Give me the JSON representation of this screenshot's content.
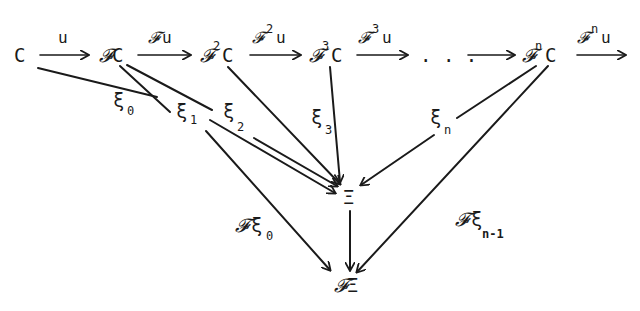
{
  "diagram": {
    "type": "commutative-diagram",
    "nodes": {
      "C": {
        "label": "C"
      },
      "FC": {
        "prefix": "𝓕",
        "label": "C"
      },
      "F2C": {
        "prefix": "𝓕",
        "sup": "2",
        "label": "C"
      },
      "F3C": {
        "prefix": "𝓕",
        "sup": "3",
        "label": "C"
      },
      "dots": {
        "label": ". . ."
      },
      "FnC": {
        "prefix": "𝓕",
        "sup": "n",
        "label": "C"
      },
      "Xi": {
        "label": "Ξ"
      },
      "FXi": {
        "prefix": "𝓕",
        "label": "Ξ"
      }
    },
    "top_arrows": [
      {
        "from": "C",
        "to": "FC",
        "label": "u"
      },
      {
        "from": "FC",
        "to": "F2C",
        "prefix": "𝓕",
        "label": "u"
      },
      {
        "from": "F2C",
        "to": "F3C",
        "prefix": "𝓕",
        "sup": "2",
        "label": "u"
      },
      {
        "from": "F3C",
        "to": "dots",
        "prefix": "𝓕",
        "sup": "3",
        "label": "u"
      },
      {
        "from": "dots",
        "to": "FnC",
        "label": ""
      },
      {
        "from": "FnC",
        "to": "next",
        "prefix": "𝓕",
        "sup": "n",
        "label": "u"
      }
    ],
    "cocone_labels": {
      "xi0": {
        "base": "ξ",
        "sub": "0"
      },
      "xi1": {
        "base": "ξ",
        "sub": "1"
      },
      "xi2": {
        "base": "ξ",
        "sub": "2"
      },
      "xi3": {
        "base": "ξ",
        "sub": "3"
      },
      "xin": {
        "base": "ξ",
        "sub": "n"
      },
      "Fxi0": {
        "prefix": "𝓕",
        "base": "ξ",
        "sub": "0"
      },
      "Fxin1": {
        "prefix": "𝓕",
        "base": "ξ",
        "sub": "n-1"
      }
    },
    "vertical_arrow": {
      "from": "Xi",
      "to": "FXi"
    }
  }
}
